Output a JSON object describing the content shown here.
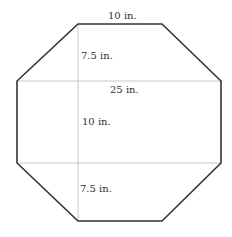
{
  "diagram": {
    "shape": "octagon",
    "labels": {
      "top": "10 in.",
      "upper_height": "7.5 in.",
      "width": "25 in.",
      "middle_height": "10 in.",
      "lower_height": "7.5 in."
    },
    "colors": {
      "outline": "#333333",
      "guide": "#c8c8c8",
      "text": "#333333"
    }
  }
}
